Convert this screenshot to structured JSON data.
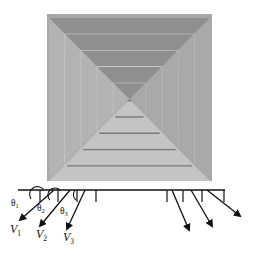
{
  "figure": {
    "diffuser": {
      "ring_count": 5,
      "colors": {
        "frame": "#a8a8a8",
        "top_face": "#8f8f8f",
        "side_face": "#b3b3b3",
        "bottom_face": "#c4c4c4",
        "edge_highlight": "#dcdcdc",
        "shadow": "#7a7a7a"
      }
    },
    "jets_left": [
      {
        "angle_label": "θ",
        "angle_sub": "1",
        "velocity_label": "V",
        "velocity_sub": "1"
      },
      {
        "angle_label": "θ",
        "angle_sub": "2",
        "velocity_label": "V",
        "velocity_sub": "2"
      },
      {
        "angle_label": "θ",
        "angle_sub": "3",
        "velocity_label": "V",
        "velocity_sub": "3"
      }
    ],
    "jets_right_count": 3,
    "line_color": "#111111"
  }
}
